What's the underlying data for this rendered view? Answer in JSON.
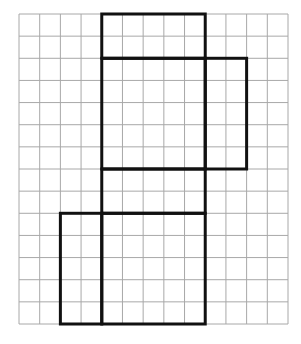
{
  "grid": {
    "columns": 13,
    "rows": 14,
    "line_color": "#a8a8a8"
  },
  "net": {
    "stroke_color": "#111111",
    "faces": [
      {
        "name": "top-face",
        "col": 4,
        "row": 0,
        "cols": 5,
        "rows": 2
      },
      {
        "name": "front-face",
        "col": 4,
        "row": 2,
        "cols": 5,
        "rows": 5
      },
      {
        "name": "right-flap",
        "col": 9,
        "row": 2,
        "cols": 2,
        "rows": 5
      },
      {
        "name": "bottom-face",
        "col": 4,
        "row": 7,
        "cols": 5,
        "rows": 2
      },
      {
        "name": "back-face",
        "col": 4,
        "row": 9,
        "cols": 5,
        "rows": 5
      },
      {
        "name": "left-flap",
        "col": 2,
        "row": 9,
        "cols": 2,
        "rows": 5
      }
    ]
  }
}
